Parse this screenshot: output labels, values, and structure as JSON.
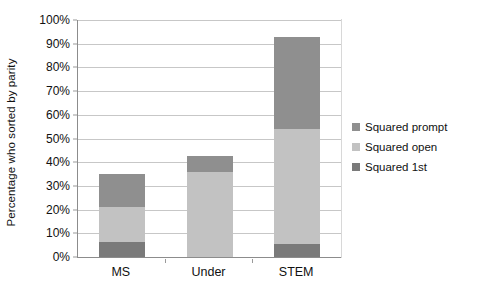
{
  "chart_data": {
    "type": "bar",
    "subtype": "stacked-bar",
    "title": "",
    "xlabel": "",
    "ylabel": "Percentage who sorted by parity",
    "categories": [
      "MS",
      "Under",
      "STEM"
    ],
    "ylim": [
      0,
      100
    ],
    "yticks": [
      0,
      10,
      20,
      30,
      40,
      50,
      60,
      70,
      80,
      90,
      100
    ],
    "ytick_labels": [
      "0%",
      "10%",
      "20%",
      "30%",
      "40%",
      "50%",
      "60%",
      "70%",
      "80%",
      "90%",
      "100%"
    ],
    "grid": true,
    "legend_position": "right",
    "stack_order_bottom_to_top": [
      "Squared 1st",
      "Squared open",
      "Squared prompt"
    ],
    "series": [
      {
        "name": "Squared 1st",
        "values": [
          6.5,
          0.0,
          5.5
        ],
        "color": "#7a7a7a"
      },
      {
        "name": "Squared open",
        "values": [
          14.5,
          36.0,
          48.5
        ],
        "color": "#c2c2c2"
      },
      {
        "name": "Squared prompt",
        "values": [
          14.0,
          6.5,
          39.0
        ],
        "color": "#8f8f8f"
      }
    ],
    "totals": [
      35.0,
      42.5,
      93.0
    ]
  },
  "legend": {
    "items": [
      {
        "label": "Squared prompt",
        "color": "#8f8f8f"
      },
      {
        "label": "Squared open",
        "color": "#c2c2c2"
      },
      {
        "label": "Squared 1st",
        "color": "#7a7a7a"
      }
    ]
  },
  "colors": {
    "background": "#ffffff",
    "axis": "#8c8c8c",
    "gridline": "#c7c7c7",
    "text": "#111111",
    "series_prompt": "#8f8f8f",
    "series_open": "#c2c2c2",
    "series_first": "#7a7a7a"
  }
}
